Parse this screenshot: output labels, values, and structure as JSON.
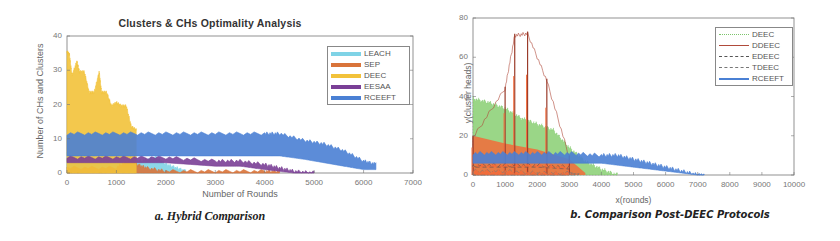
{
  "chart_data": [
    {
      "id": "a",
      "type": "area",
      "title": "Clusters & CHs Optimality Analysis",
      "xlabel": "Number of Rounds",
      "ylabel": "Number of CHs and Clusters",
      "caption": "a. Hybrid Comparison",
      "xlim": [
        0,
        7000
      ],
      "ylim": [
        0,
        40
      ],
      "xticks": [
        0,
        1000,
        2000,
        3000,
        4000,
        5000,
        6000,
        7000
      ],
      "yticks": [
        0,
        10,
        20,
        30,
        40
      ],
      "grid": false,
      "legend_position": "upper right",
      "series": [
        {
          "name": "LEACH",
          "color": "#7fd3e6",
          "style": "solid",
          "x": [
            0,
            500,
            1000,
            1300,
            1500,
            1800,
            2000,
            2200,
            2400
          ],
          "y_upper": [
            6,
            5,
            5,
            4,
            4,
            5,
            3,
            2,
            1
          ],
          "y_lower": [
            0,
            0,
            0,
            0,
            0,
            0,
            0,
            0,
            0
          ]
        },
        {
          "name": "SEP",
          "color": "#d9743a",
          "style": "solid",
          "x": [
            0,
            1000,
            1300,
            1400,
            1600,
            2000,
            3000,
            4000,
            4300
          ],
          "y_upper": [
            2,
            2,
            5,
            3,
            2,
            1,
            1,
            1,
            1
          ],
          "y_lower": [
            0,
            0,
            0,
            0,
            0,
            0,
            0,
            0,
            0
          ]
        },
        {
          "name": "DEEC",
          "color": "#f2c23a",
          "style": "solid",
          "x": [
            0,
            50,
            100,
            200,
            250,
            350,
            450,
            550,
            650,
            700,
            800,
            900,
            1000,
            1100,
            1200,
            1300,
            1400
          ],
          "y_upper": [
            36,
            35,
            29,
            33,
            30,
            30,
            24,
            24,
            30,
            24,
            24,
            20,
            21,
            20,
            20,
            14,
            13
          ],
          "y_lower": [
            0,
            0,
            0,
            0,
            0,
            0,
            0,
            0,
            0,
            0,
            0,
            0,
            0,
            0,
            0,
            0,
            0
          ]
        },
        {
          "name": "EESAA",
          "color": "#7a3f96",
          "style": "solid",
          "x": [
            0,
            1000,
            2000,
            3000,
            3500,
            4000,
            4300,
            4600,
            5000
          ],
          "y_upper": [
            5,
            5,
            5,
            4,
            4,
            3,
            2,
            1,
            0.5
          ],
          "y_lower": [
            3,
            3,
            3,
            2,
            2,
            1,
            0.5,
            0,
            0
          ]
        },
        {
          "name": "RCEEFT",
          "color": "#4a80d4",
          "style": "solid",
          "x": [
            0,
            1000,
            2000,
            3000,
            4000,
            4300,
            4800,
            5200,
            5600,
            6000,
            6250
          ],
          "y_upper": [
            12,
            12,
            12,
            12,
            12,
            12,
            10,
            9,
            7,
            4,
            3
          ],
          "y_lower": [
            5,
            5,
            5,
            5,
            5,
            5,
            4,
            3,
            2,
            1,
            1
          ]
        }
      ]
    },
    {
      "id": "b",
      "type": "line",
      "title": "",
      "xlabel": "x(rounds)",
      "ylabel": "y(cluster heads)",
      "caption": "b. Comparison Post-DEEC Protocols",
      "xlim": [
        0,
        10000
      ],
      "ylim": [
        0,
        80
      ],
      "xticks": [
        0,
        1000,
        2000,
        3000,
        4000,
        5000,
        6000,
        7000,
        8000,
        9000,
        10000
      ],
      "yticks": [
        0,
        20,
        40,
        60,
        80
      ],
      "grid": false,
      "legend_position": "upper right",
      "series": [
        {
          "name": "DEEC",
          "color": "#7cc46b",
          "style": "dotted",
          "x": [
            0,
            500,
            1000,
            1500,
            2000,
            2500,
            3000,
            3500,
            4000,
            4500
          ],
          "y_upper": [
            40,
            38,
            35,
            30,
            27,
            24,
            15,
            8,
            4,
            1
          ],
          "y_lower": [
            0,
            0,
            0,
            0,
            0,
            0,
            0,
            0,
            0,
            0
          ]
        },
        {
          "name": "DDEEC",
          "color": "#b04a3a",
          "style": "solid",
          "x": [
            0,
            1000,
            1300,
            1700,
            2300,
            3000
          ],
          "y_upper": [
            20,
            45,
            72,
            73,
            49,
            10
          ],
          "y_lower": [
            0,
            0,
            0,
            0,
            0,
            0
          ]
        },
        {
          "name": "EDEEC",
          "color": "#555555",
          "style": "dashed",
          "x": [
            0,
            1000,
            2000,
            3000
          ],
          "y_upper": [
            6,
            6,
            6,
            5
          ],
          "y_lower": [
            4,
            4,
            4,
            3
          ]
        },
        {
          "name": "TDEEC",
          "color": "#777777",
          "style": "dashdot",
          "x": [
            0,
            1000,
            2000,
            3000,
            3300
          ],
          "y_upper": [
            3,
            3,
            2,
            2,
            1
          ],
          "y_lower": [
            0,
            0,
            0,
            0,
            0
          ]
        },
        {
          "name": "RCEEFT",
          "color": "#4a80d4",
          "style": "solid",
          "x": [
            0,
            1000,
            2000,
            3000,
            4000,
            4500,
            5000,
            5500,
            6000,
            6500,
            7000,
            7200
          ],
          "y_upper": [
            12,
            12,
            12,
            12,
            11,
            11,
            9,
            7,
            5,
            3,
            1,
            0.5
          ],
          "y_lower": [
            6,
            6,
            6,
            6,
            6,
            5,
            4,
            3,
            2,
            1,
            0,
            0
          ]
        }
      ],
      "fill_colors": {
        "orange_band": "#f26b3a",
        "green_band": "#8fd27a"
      }
    }
  ]
}
